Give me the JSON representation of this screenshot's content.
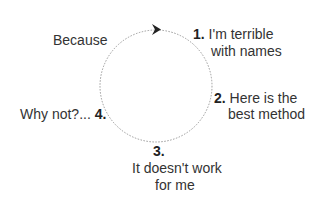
{
  "diagram": {
    "type": "cycle",
    "steps": [
      {
        "number": "1.",
        "line1": "I'm terrible",
        "line2": "with names"
      },
      {
        "number": "2.",
        "line1": "Here is the",
        "line2": "best method"
      },
      {
        "number": "3.",
        "line1": "It doesn't work",
        "line2": "for me"
      },
      {
        "number": "4.",
        "prefix": "Why not?..."
      }
    ],
    "loop_label": "Because",
    "colors": {
      "text": "#333333",
      "circle": "#999999",
      "arrow": "#222222"
    }
  }
}
